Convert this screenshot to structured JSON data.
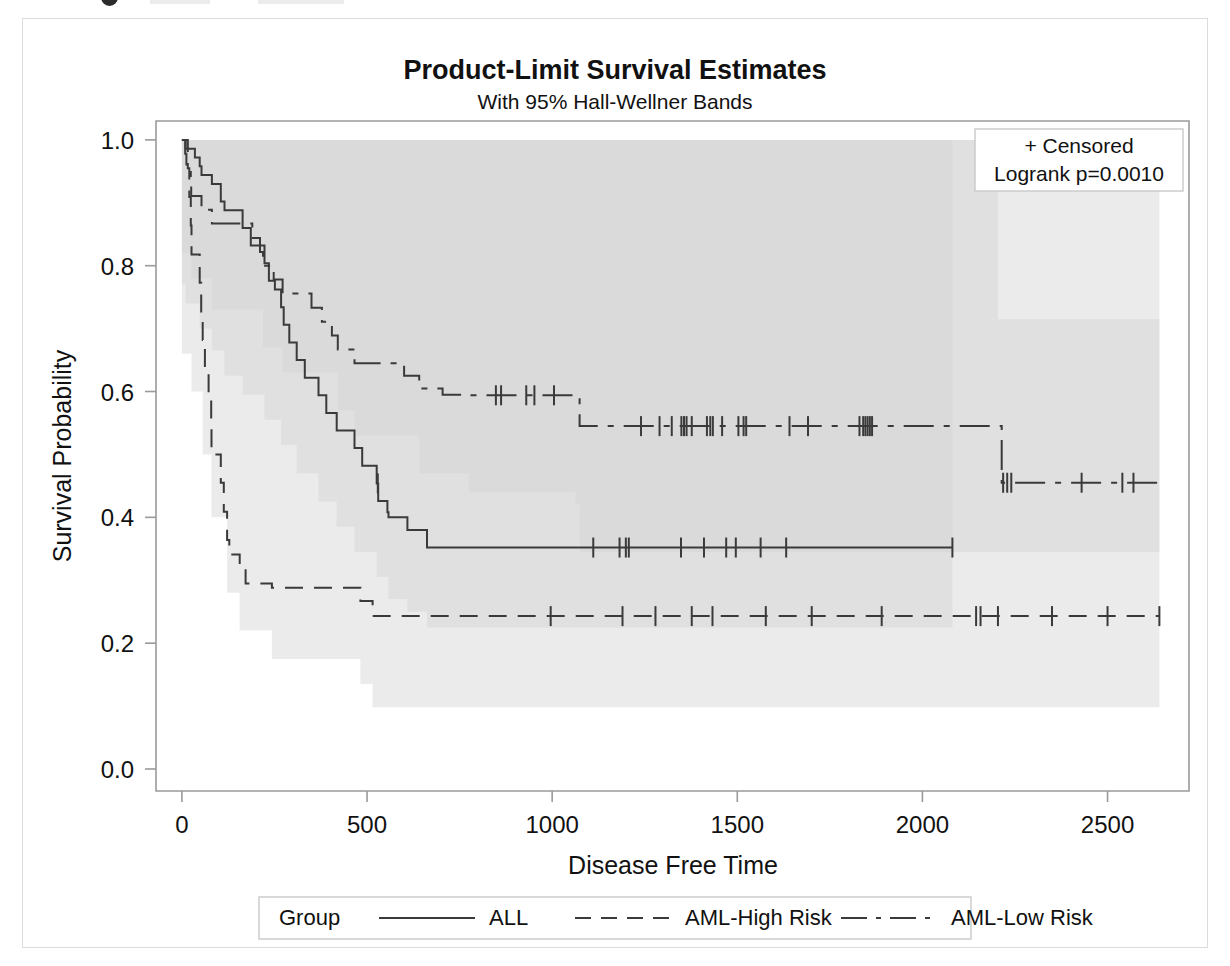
{
  "figure": {
    "title": "Product-Limit Survival Estimates",
    "subtitle": "With 95% Hall-Wellner Bands"
  },
  "stat_box": {
    "censored_label": "+ Censored",
    "logrank_label": "Logrank p=0.0010"
  },
  "legend": {
    "title": "Group",
    "items": [
      {
        "label": "ALL",
        "dash": "solid"
      },
      {
        "label": "AML-High Risk",
        "dash": "dashed"
      },
      {
        "label": "AML-Low Risk",
        "dash": "dash-dot"
      }
    ]
  },
  "chart_data": {
    "type": "line",
    "title": "Product-Limit Survival Estimates",
    "subtitle": "With 95% Hall-Wellner Bands",
    "xlabel": "Disease Free Time",
    "ylabel": "Survival Probability",
    "xlim": [
      -70,
      2720
    ],
    "ylim": [
      -0.035,
      1.03
    ],
    "xticks": [
      0,
      500,
      1000,
      1500,
      2000,
      2500
    ],
    "xtick_labels": [
      "0",
      "500",
      "1000",
      "1500",
      "2000",
      "2500"
    ],
    "yticks": [
      0.0,
      0.2,
      0.4,
      0.6,
      0.8,
      1.0
    ],
    "ytick_labels": [
      "0.0",
      "0.2",
      "0.4",
      "0.6",
      "0.8",
      "1.0"
    ],
    "grid": false,
    "legend_position": "bottom",
    "band_type": "95% Hall-Wellner",
    "band_fill_color": "#d2d2d2",
    "curve_color": "#3a3a3a",
    "annotations": [
      "+ Censored",
      "Logrank p=0.0010"
    ],
    "series": [
      {
        "name": "ALL",
        "dash": "solid",
        "steps": [
          [
            0,
            1.0
          ],
          [
            10,
            0.986
          ],
          [
            35,
            0.972
          ],
          [
            48,
            0.958
          ],
          [
            53,
            0.944
          ],
          [
            81,
            0.93
          ],
          [
            105,
            0.902
          ],
          [
            115,
            0.888
          ],
          [
            164,
            0.86
          ],
          [
            186,
            0.832
          ],
          [
            223,
            0.804
          ],
          [
            235,
            0.776
          ],
          [
            251,
            0.762
          ],
          [
            268,
            0.734
          ],
          [
            275,
            0.706
          ],
          [
            290,
            0.678
          ],
          [
            310,
            0.65
          ],
          [
            332,
            0.622
          ],
          [
            369,
            0.594
          ],
          [
            390,
            0.566
          ],
          [
            418,
            0.538
          ],
          [
            466,
            0.51
          ],
          [
            487,
            0.482
          ],
          [
            526,
            0.454
          ],
          [
            530,
            0.426
          ],
          [
            555,
            0.408
          ],
          [
            558,
            0.4
          ],
          [
            609,
            0.38
          ],
          [
            662,
            0.352
          ],
          [
            2081,
            0.352
          ]
        ],
        "censored_times": [
          529,
          1111,
          1182,
          1199,
          1207,
          1348,
          1410,
          1470,
          1496,
          1563,
          1632,
          2081
        ],
        "band_lower": [
          [
            0,
            0.77
          ],
          [
            10,
            0.74
          ],
          [
            48,
            0.7
          ],
          [
            81,
            0.665
          ],
          [
            115,
            0.625
          ],
          [
            164,
            0.595
          ],
          [
            223,
            0.555
          ],
          [
            268,
            0.515
          ],
          [
            310,
            0.47
          ],
          [
            369,
            0.425
          ],
          [
            418,
            0.385
          ],
          [
            466,
            0.345
          ],
          [
            526,
            0.305
          ],
          [
            558,
            0.27
          ],
          [
            609,
            0.25
          ],
          [
            662,
            0.225
          ],
          [
            2081,
            0.225
          ]
        ],
        "band_upper": [
          [
            0,
            1.0
          ],
          [
            662,
            1.0
          ],
          [
            2081,
            1.0
          ]
        ]
      },
      {
        "name": "AML-High Risk",
        "dash": "dashed",
        "steps": [
          [
            0,
            1.0
          ],
          [
            16,
            0.955
          ],
          [
            20,
            0.909
          ],
          [
            24,
            0.864
          ],
          [
            26,
            0.818
          ],
          [
            48,
            0.773
          ],
          [
            52,
            0.727
          ],
          [
            56,
            0.682
          ],
          [
            62,
            0.636
          ],
          [
            72,
            0.591
          ],
          [
            79,
            0.545
          ],
          [
            80,
            0.5
          ],
          [
            105,
            0.455
          ],
          [
            113,
            0.409
          ],
          [
            122,
            0.364
          ],
          [
            128,
            0.341
          ],
          [
            156,
            0.318
          ],
          [
            172,
            0.295
          ],
          [
            243,
            0.288
          ],
          [
            268,
            0.288
          ],
          [
            482,
            0.267
          ],
          [
            515,
            0.243
          ],
          [
            2640,
            0.243
          ]
        ],
        "censored_times": [
          996,
          1190,
          1279,
          1377,
          1433,
          1577,
          1701,
          1890,
          2145,
          2157,
          2204,
          2350,
          2500,
          2640
        ],
        "band_lower": [
          [
            0,
            0.66
          ],
          [
            26,
            0.6
          ],
          [
            56,
            0.5
          ],
          [
            80,
            0.4
          ],
          [
            122,
            0.28
          ],
          [
            156,
            0.22
          ],
          [
            243,
            0.175
          ],
          [
            482,
            0.135
          ],
          [
            515,
            0.098
          ],
          [
            2640,
            0.098
          ]
        ],
        "band_upper": [
          [
            0,
            1.0
          ],
          [
            515,
            1.0
          ],
          [
            2640,
            1.0
          ]
        ]
      },
      {
        "name": "AML-Low Risk",
        "dash": "dash-dot",
        "steps": [
          [
            0,
            1.0
          ],
          [
            9,
            0.978
          ],
          [
            12,
            0.956
          ],
          [
            24,
            0.933
          ],
          [
            25,
            0.911
          ],
          [
            53,
            0.889
          ],
          [
            81,
            0.867
          ],
          [
            180,
            0.867
          ],
          [
            190,
            0.844
          ],
          [
            211,
            0.822
          ],
          [
            219,
            0.8
          ],
          [
            248,
            0.778
          ],
          [
            272,
            0.756
          ],
          [
            350,
            0.733
          ],
          [
            378,
            0.711
          ],
          [
            405,
            0.689
          ],
          [
            421,
            0.667
          ],
          [
            466,
            0.645
          ],
          [
            530,
            0.645
          ],
          [
            600,
            0.625
          ],
          [
            641,
            0.605
          ],
          [
            704,
            0.595
          ],
          [
            748,
            0.595
          ],
          [
            775,
            0.594
          ],
          [
            1063,
            0.594
          ],
          [
            1074,
            0.545
          ],
          [
            2204,
            0.545
          ],
          [
            2214,
            0.455
          ],
          [
            2640,
            0.455
          ]
        ],
        "censored_times": [
          848,
          862,
          930,
          952,
          1005,
          1240,
          1290,
          1323,
          1349,
          1356,
          1363,
          1377,
          1418,
          1427,
          1434,
          1459,
          1503,
          1517,
          1524,
          1641,
          1691,
          1830,
          1840,
          1846,
          1852,
          1858,
          1864,
          2218,
          2229,
          2240,
          2430,
          2540,
          2570
        ],
        "band_lower": [
          [
            0,
            0.82
          ],
          [
            25,
            0.78
          ],
          [
            81,
            0.73
          ],
          [
            219,
            0.67
          ],
          [
            272,
            0.63
          ],
          [
            421,
            0.57
          ],
          [
            466,
            0.53
          ],
          [
            641,
            0.47
          ],
          [
            775,
            0.44
          ],
          [
            1063,
            0.42
          ],
          [
            1074,
            0.345
          ],
          [
            2204,
            0.345
          ],
          [
            2214,
            0.345
          ],
          [
            2640,
            0.345
          ]
        ],
        "band_upper": [
          [
            0,
            1.0
          ],
          [
            1074,
            1.0
          ],
          [
            2204,
            0.715
          ],
          [
            2640,
            0.715
          ]
        ]
      }
    ]
  }
}
